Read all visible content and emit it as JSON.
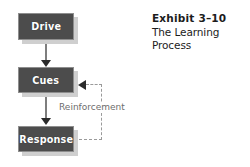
{
  "figure": {
    "width": 250,
    "height": 167,
    "background": "#ffffff"
  },
  "caption": {
    "number": "Exhibit 3–10",
    "title": "The Learning Process",
    "full_text": "Exhibit 3–10 The Learning Process"
  },
  "diagram": {
    "type": "flowchart",
    "title": "The Learning Process",
    "node_fill": "#4c4c4c",
    "node_border": "#8e8e8e",
    "node_text_color": "#ffffff",
    "connector_color": "#7e7e7e",
    "arrowhead_color": "#2b2b2b",
    "feedback_color": "#9a9a9a",
    "nodes": [
      {
        "id": "drive",
        "label": "Drive"
      },
      {
        "id": "cues",
        "label": "Cues"
      },
      {
        "id": "response",
        "label": "Response"
      }
    ],
    "edges": [
      {
        "from": "drive",
        "to": "cues",
        "style": "solid",
        "label": ""
      },
      {
        "from": "cues",
        "to": "response",
        "style": "solid",
        "label": ""
      },
      {
        "from": "response",
        "to": "cues",
        "style": "dashed",
        "label": "Reinforcement"
      }
    ],
    "labels": {
      "reinforcement": "Reinforcement"
    }
  }
}
